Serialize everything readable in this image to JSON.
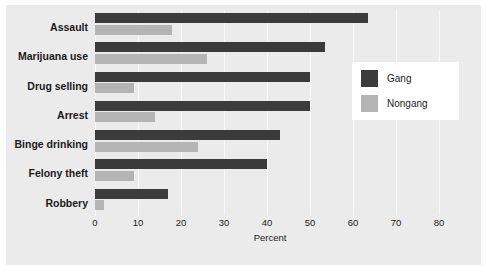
{
  "chart_data": {
    "type": "bar",
    "orientation": "horizontal",
    "title": "",
    "xlabel": "Percent",
    "ylabel": "",
    "xlim": [
      0,
      81.4
    ],
    "xticks": [
      0,
      10,
      20,
      30,
      40,
      50,
      60,
      70,
      80
    ],
    "grid": true,
    "legend_position": "right",
    "categories": [
      "Assault",
      "Marijuana use",
      "Drug selling",
      "Arrest",
      "Binge drinking",
      "Felony theft",
      "Robbery"
    ],
    "series": [
      {
        "name": "Gang",
        "color": "#3b3b3b",
        "values": [
          63.5,
          53.5,
          50,
          50,
          43,
          40,
          17
        ]
      },
      {
        "name": "Nongang",
        "color": "#b4b4b4",
        "values": [
          18,
          26,
          9,
          14,
          24,
          9,
          2
        ]
      }
    ]
  },
  "axis": {
    "tick_labels": [
      "0",
      "10",
      "20",
      "30",
      "40",
      "50",
      "60",
      "70",
      "80"
    ],
    "title": "Percent"
  },
  "legend": {
    "items": [
      {
        "label": "Gang"
      },
      {
        "label": "Nongang"
      }
    ]
  },
  "colors": {
    "gang": "#3b3b3b",
    "nongang": "#b4b4b4",
    "panel": "#ebebeb",
    "page": "#ffffff",
    "gridline": "#f7f7f7"
  }
}
